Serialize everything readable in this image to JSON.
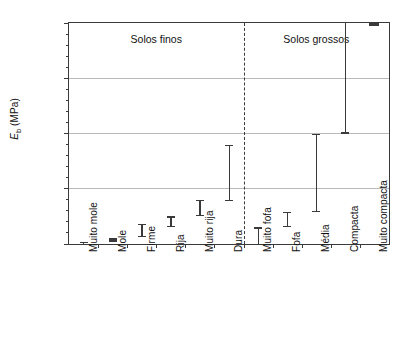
{
  "chart_data": {
    "type": "bar",
    "subtype": "range-interval (error bars without markers)",
    "title": "",
    "xlabel": "",
    "ylabel": "E_b (MPa)",
    "ylabel_main": "E",
    "ylabel_sub": "b",
    "ylabel_units": " (MPa)",
    "ylim": [
      0,
      200
    ],
    "ytick_labels": [
      "0",
      "50",
      "100",
      "150",
      "200"
    ],
    "ytick_values": [
      0,
      50,
      100,
      150,
      200
    ],
    "yminor_step": 10,
    "grid": "horizontal gridlines at 50, 100, 150",
    "legend": "none",
    "categories": [
      "Muito mole",
      "Mole",
      "Firme",
      "Rija",
      "Muito rija",
      "Dura",
      "Muito fofa",
      "Fofa",
      "Média",
      "Compacta",
      "Muito compacta"
    ],
    "ranges": [
      {
        "category": "Muito mole",
        "low": 0,
        "high": 2,
        "clipped_high": false
      },
      {
        "category": "Mole",
        "low": 2,
        "high": 5,
        "clipped_high": false
      },
      {
        "category": "Firme",
        "low": 6,
        "high": 18,
        "clipped_high": false
      },
      {
        "category": "Rija",
        "low": 15,
        "high": 25,
        "clipped_high": false
      },
      {
        "category": "Muito rija",
        "low": 25,
        "high": 40,
        "clipped_high": false
      },
      {
        "category": "Dura",
        "low": 39,
        "high": 90,
        "clipped_high": false
      },
      {
        "category": "Muito fofa",
        "low": 0,
        "high": 15,
        "clipped_high": false
      },
      {
        "category": "Fofa",
        "low": 15,
        "high": 29,
        "clipped_high": false
      },
      {
        "category": "Média",
        "low": 29,
        "high": 100,
        "clipped_high": false
      },
      {
        "category": "Compacta",
        "low": 100,
        "high": 200,
        "clipped_high": true
      },
      {
        "category": "Muito compacta",
        "low": 199,
        "high": 200,
        "clipped_high": true
      }
    ],
    "annotations": [
      {
        "text": "Solos finos",
        "group": "left",
        "categories": [
          "Muito mole",
          "Mole",
          "Firme",
          "Rija",
          "Muito rija",
          "Dura"
        ]
      },
      {
        "text": "Solos grossos",
        "group": "right",
        "categories": [
          "Muito fofa",
          "Fofa",
          "Média",
          "Compacta",
          "Muito compacta"
        ]
      }
    ],
    "divider": {
      "style": "dashed",
      "between": [
        "Dura",
        "Muito fofa"
      ]
    },
    "colors": {
      "background": "#ffffff",
      "axis": "#3a3a3a",
      "grid": "#b9b9b9",
      "series": "#3a3a3a",
      "text": "#111111"
    }
  }
}
